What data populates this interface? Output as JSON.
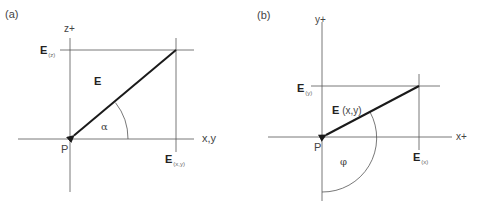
{
  "panel_a": {
    "tag": "(a)",
    "vertical_axis_label": "z+",
    "horizontal_axis_label": "x,y",
    "origin_label": "P",
    "vector_label": "E",
    "top_component": {
      "symbol": "E",
      "subscript": "(z)"
    },
    "right_component": {
      "symbol": "E",
      "subscript": "(x,y)"
    },
    "angle_label": "α"
  },
  "panel_b": {
    "tag": "(b)",
    "vertical_axis_label": "y+",
    "horizontal_axis_label": "x+",
    "origin_label": "P",
    "vector_label": {
      "symbol": "E",
      "suffix": "(x,y)"
    },
    "top_component": {
      "symbol": "E",
      "subscript": "(y)"
    },
    "right_component": {
      "symbol": "E",
      "subscript": "(x)"
    },
    "angle_label": "φ"
  },
  "colors": {
    "axis": "#555555",
    "vector": "#1a1a1a",
    "text": "#444444"
  }
}
